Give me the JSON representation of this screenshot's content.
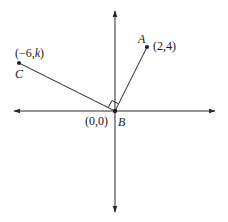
{
  "diagram": {
    "type": "coordinate-plane",
    "colors": {
      "line": "#2a2a2a",
      "text": "#1a1a1a",
      "background": "#ffffff"
    },
    "axes": {
      "x_axis": "horizontal with arrows both ends",
      "y_axis": "vertical with arrows both ends"
    },
    "points": {
      "A": {
        "name": "A",
        "coords": "(2,4)"
      },
      "B": {
        "name": "B",
        "coords": "(0,0)"
      },
      "C": {
        "name": "C",
        "coords_prefix": "(−6,",
        "coords_var": "k",
        "coords_suffix": ")"
      }
    },
    "segments": [
      "BA",
      "BC"
    ],
    "right_angle_at": "B"
  }
}
